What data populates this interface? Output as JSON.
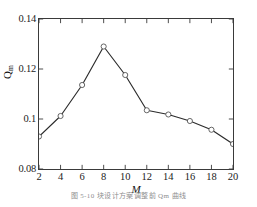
{
  "figure": {
    "caption": "图 5-10  块设计方案调整前 Qm 曲线"
  },
  "chart_data": {
    "type": "line",
    "title": "",
    "subtitle": "",
    "xlabel": "M",
    "ylabel": "Qm",
    "ylabel_base": "Q",
    "ylabel_sub": "m",
    "x": [
      2,
      4,
      6,
      8,
      10,
      12,
      14,
      16,
      18,
      20
    ],
    "values": [
      0.093,
      0.1012,
      0.1136,
      0.129,
      0.1176,
      0.1035,
      0.1018,
      0.0992,
      0.0957,
      0.09
    ],
    "series": [
      {
        "name": "Qm",
        "values": [
          0.093,
          0.1012,
          0.1136,
          0.129,
          0.1176,
          0.1035,
          0.1018,
          0.0992,
          0.0957,
          0.09
        ]
      }
    ],
    "xlim": [
      2,
      20
    ],
    "ylim": [
      0.08,
      0.14
    ],
    "xticks": [
      2,
      4,
      6,
      8,
      10,
      12,
      14,
      16,
      18,
      20
    ],
    "xtick_labels": [
      "2",
      "4",
      "6",
      "8",
      "10",
      "12",
      "14",
      "16",
      "18",
      "20"
    ],
    "yticks": [
      0.08,
      0.1,
      0.12,
      0.14
    ],
    "ytick_labels": [
      "0.08",
      "0.1",
      "0.12",
      "0.14"
    ],
    "grid": false,
    "legend": false,
    "legend_position": "none",
    "marker": "open-circle",
    "line_color": "#2b2b2b",
    "marker_edge_color": "#555555",
    "marker_face_color": "#ffffff",
    "axis_color": "#3a3a3a",
    "background_color": "#ffffff",
    "annotations": []
  }
}
